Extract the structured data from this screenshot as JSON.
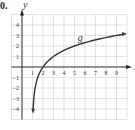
{
  "problem_number": "0.",
  "chart_data": {
    "type": "line",
    "title": "",
    "xlabel": "x",
    "ylabel": "y",
    "xlim": [
      -1,
      10
    ],
    "ylim": [
      -5,
      5
    ],
    "grid": true,
    "x_ticks": [
      1,
      2,
      3,
      4,
      5,
      6,
      7,
      8,
      9
    ],
    "y_ticks": [
      -4,
      -3,
      -2,
      -1,
      1,
      2,
      3,
      4
    ],
    "series": [
      {
        "name": "g",
        "function": "g(x) = log2(x - 1)",
        "x": [
          1.06,
          1.125,
          1.25,
          1.5,
          2,
          3,
          4,
          5,
          6,
          7,
          8,
          9,
          9.6
        ],
        "values": [
          -4.06,
          -3,
          -2,
          -1,
          0,
          1,
          1.58,
          2,
          2.32,
          2.58,
          2.81,
          3,
          3.1
        ]
      }
    ],
    "annotations": [
      {
        "text": "g",
        "x": 5.3,
        "y": 2.5
      }
    ],
    "colors": {
      "curve": "#333333",
      "grid": "#cfcfcf",
      "axis": "#222222"
    }
  }
}
